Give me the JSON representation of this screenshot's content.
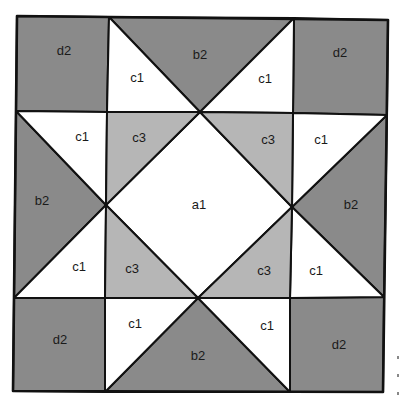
{
  "diagram": {
    "colors": {
      "d": "#8a8a8a",
      "b": "#8a8a8a",
      "c3": "#b6b6b6",
      "c1": "#ffffff",
      "a": "#ffffff",
      "line": "#111111"
    },
    "pieces": [
      {
        "id": "corner-tl",
        "label": "d2",
        "fabric": "d",
        "shape": "square"
      },
      {
        "id": "corner-tr",
        "label": "d2",
        "fabric": "d",
        "shape": "square"
      },
      {
        "id": "corner-bl",
        "label": "d2",
        "fabric": "d",
        "shape": "square"
      },
      {
        "id": "corner-br",
        "label": "d2",
        "fabric": "d",
        "shape": "square"
      },
      {
        "id": "center",
        "label": "a1",
        "fabric": "a",
        "shape": "diamond"
      },
      {
        "id": "side-top",
        "label": "b2",
        "fabric": "b",
        "shape": "triangle"
      },
      {
        "id": "side-left",
        "label": "b2",
        "fabric": "b",
        "shape": "triangle"
      },
      {
        "id": "side-right",
        "label": "b2",
        "fabric": "b",
        "shape": "triangle"
      },
      {
        "id": "side-bottom",
        "label": "b2",
        "fabric": "b",
        "shape": "triangle"
      },
      {
        "id": "star-top-left",
        "label": "c1",
        "fabric": "c1",
        "shape": "triangle"
      },
      {
        "id": "star-top-right",
        "label": "c1",
        "fabric": "c1",
        "shape": "triangle"
      },
      {
        "id": "star-left-upper",
        "label": "c1",
        "fabric": "c1",
        "shape": "triangle"
      },
      {
        "id": "star-left-lower",
        "label": "c1",
        "fabric": "c1",
        "shape": "triangle"
      },
      {
        "id": "star-right-upper",
        "label": "c1",
        "fabric": "c1",
        "shape": "triangle"
      },
      {
        "id": "star-right-lower",
        "label": "c1",
        "fabric": "c1",
        "shape": "triangle"
      },
      {
        "id": "star-bottom-left",
        "label": "c1",
        "fabric": "c1",
        "shape": "triangle"
      },
      {
        "id": "star-bottom-right",
        "label": "c1",
        "fabric": "c1",
        "shape": "triangle"
      },
      {
        "id": "inner-tl",
        "label": "c3",
        "fabric": "c3",
        "shape": "triangle"
      },
      {
        "id": "inner-tr",
        "label": "c3",
        "fabric": "c3",
        "shape": "triangle"
      },
      {
        "id": "inner-bl",
        "label": "c3",
        "fabric": "c3",
        "shape": "triangle"
      },
      {
        "id": "inner-br",
        "label": "c3",
        "fabric": "c3",
        "shape": "triangle"
      }
    ]
  }
}
